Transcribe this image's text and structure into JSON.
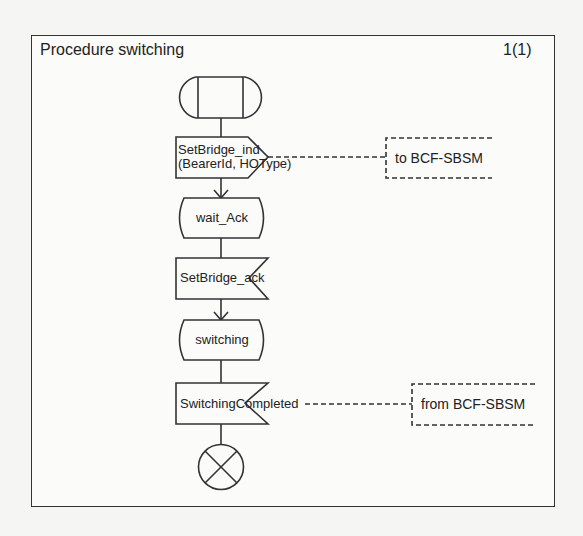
{
  "diagram": {
    "title": "Procedure switching",
    "page_indicator": "1(1)",
    "type": "SDL process diagram",
    "nodes": [
      {
        "id": "start",
        "kind": "procedure-start",
        "label": ""
      },
      {
        "id": "out1",
        "kind": "output-signal",
        "line1": "SetBridge_ind",
        "line2": "(BearerId, HOType)"
      },
      {
        "id": "state1",
        "kind": "state",
        "label": "wait_Ack"
      },
      {
        "id": "in1",
        "kind": "input-signal",
        "label": "SetBridge_ack"
      },
      {
        "id": "state2",
        "kind": "state",
        "label": "switching"
      },
      {
        "id": "in2",
        "kind": "input-signal",
        "label": "SwitchingCompleted"
      },
      {
        "id": "stop",
        "kind": "stop",
        "label": ""
      }
    ],
    "comments": [
      {
        "attached_to": "out1",
        "label": "to BCF-SBSM"
      },
      {
        "attached_to": "in2",
        "label": "from BCF-SBSM"
      }
    ],
    "colors": {
      "line": "#333333",
      "background": "#fbfbfa"
    }
  }
}
